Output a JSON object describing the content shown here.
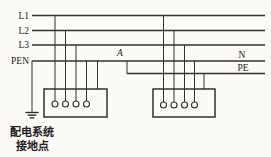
{
  "colors": {
    "line": "#33312e",
    "background": "#fbfaf6",
    "text": "#23211e"
  },
  "canvas": {
    "width": 271,
    "height": 157
  },
  "buses": [
    {
      "name": "bus-L1",
      "y": 15.5,
      "x1": 32,
      "x2": 265
    },
    {
      "name": "bus-L2",
      "y": 30.5,
      "x1": 32,
      "x2": 265
    },
    {
      "name": "bus-L3",
      "y": 45,
      "x1": 32,
      "x2": 265
    },
    {
      "name": "bus-PEN-N",
      "y": 61,
      "x1": 32,
      "x2": 265
    },
    {
      "name": "bus-PE",
      "y": 73.5,
      "x1": 127,
      "x2": 265
    }
  ],
  "labels": [
    {
      "name": "label-L1",
      "text": "L1",
      "x": 29,
      "y": 18.5,
      "anchor": "end",
      "style": "normal"
    },
    {
      "name": "label-L2",
      "text": "L2",
      "x": 29,
      "y": 33.5,
      "anchor": "end",
      "style": "normal"
    },
    {
      "name": "label-L3",
      "text": "L3",
      "x": 29,
      "y": 48,
      "anchor": "end",
      "style": "normal"
    },
    {
      "name": "label-PEN",
      "text": "PEN",
      "x": 29,
      "y": 64,
      "anchor": "end",
      "style": "normal"
    },
    {
      "name": "label-point-A",
      "text": "A",
      "x": 120,
      "y": 55.5,
      "anchor": "middle",
      "style": "italic"
    },
    {
      "name": "label-N",
      "text": "N",
      "x": 242,
      "y": 57.5,
      "anchor": "middle",
      "style": "normal"
    },
    {
      "name": "label-PE",
      "text": "PE",
      "x": 243,
      "y": 71,
      "anchor": "middle",
      "style": "normal"
    }
  ],
  "drops": [
    {
      "name": "drop-L1-to-left-box",
      "x": 55,
      "y1": 15.5,
      "y2": 101
    },
    {
      "name": "drop-L2-to-left-box",
      "x": 65.5,
      "y1": 30.5,
      "y2": 101
    },
    {
      "name": "drop-L3-to-left-box",
      "x": 76,
      "y1": 45,
      "y2": 101
    },
    {
      "name": "drop-PEN-to-left-box",
      "x": 86.5,
      "y1": 61,
      "y2": 101
    },
    {
      "name": "drop-PEN-to-left-case",
      "x": 97.5,
      "y1": 61,
      "y2": 89
    },
    {
      "name": "drop-PEN-to-earth",
      "x": 32,
      "y1": 61,
      "y2": 112.5
    },
    {
      "name": "drop-A-split-PEN-to-PE",
      "x": 127,
      "y1": 61,
      "y2": 73.5
    },
    {
      "name": "drop-L1-to-right-box",
      "x": 163.5,
      "y1": 15.5,
      "y2": 102
    },
    {
      "name": "drop-L2-to-right-box",
      "x": 174,
      "y1": 30.5,
      "y2": 102
    },
    {
      "name": "drop-L3-to-right-box",
      "x": 184.5,
      "y1": 45,
      "y2": 102
    },
    {
      "name": "drop-N-to-right-box",
      "x": 194.5,
      "y1": 61,
      "y2": 102
    },
    {
      "name": "drop-PE-to-right-case",
      "x": 204,
      "y1": 73.5,
      "y2": 89
    }
  ],
  "equipment": [
    {
      "name": "equipment-box-left",
      "x": 44,
      "y": 89,
      "w": 63,
      "h": 28,
      "terminal_y": 104,
      "terminal_r": 3,
      "terminals_x": [
        55,
        65.5,
        76,
        86.5
      ]
    },
    {
      "name": "equipment-box-right",
      "x": 153,
      "y": 89,
      "w": 62,
      "h": 28,
      "terminal_y": 105,
      "terminal_r": 3,
      "terminals_x": [
        163.5,
        174,
        184.5,
        194.5
      ]
    }
  ],
  "ground_symbol": {
    "x": 32,
    "top_y": 112.5,
    "bar_widths": [
      13,
      8.5,
      4.5
    ],
    "bar_gap": 2.7
  },
  "ground_label": {
    "line1": "配电系统",
    "line2": "接地点",
    "x": 32,
    "y1": 136,
    "y2": 149.5
  }
}
